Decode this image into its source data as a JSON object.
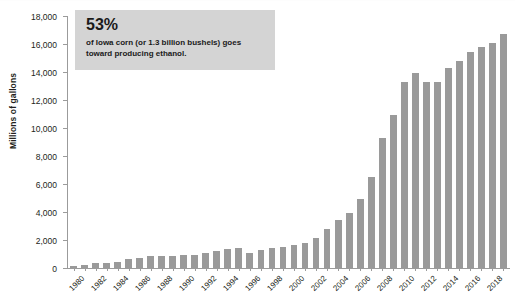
{
  "chart_data": {
    "type": "bar",
    "title": "",
    "subtitle": "",
    "xlabel": "",
    "ylabel": "Millions of gallons",
    "ylim": [
      0,
      18000
    ],
    "ytick_values": [
      0,
      2000,
      4000,
      6000,
      8000,
      10000,
      12000,
      14000,
      16000,
      18000
    ],
    "ytick_labels": [
      "0",
      "2,000",
      "4,000",
      "6,000",
      "8,000",
      "10,000",
      "12,000",
      "14,000",
      "16,000",
      "18,000"
    ],
    "grid": false,
    "legend": "none",
    "bar_color": "#9a9a9a",
    "categories": [
      "1980",
      "1981",
      "1982",
      "1983",
      "1984",
      "1985",
      "1986",
      "1987",
      "1988",
      "1989",
      "1990",
      "1991",
      "1992",
      "1993",
      "1994",
      "1995",
      "1996",
      "1997",
      "1998",
      "1999",
      "2000",
      "2001",
      "2002",
      "2003",
      "2004",
      "2005",
      "2006",
      "2007",
      "2008",
      "2009",
      "2010",
      "2011",
      "2012",
      "2013",
      "2014",
      "2015",
      "2016",
      "2017",
      "2018",
      "2019"
    ],
    "xtick_labels": [
      "1980",
      "1982",
      "1984",
      "1986",
      "1988",
      "1990",
      "1992",
      "1994",
      "1996",
      "1998",
      "2000",
      "2002",
      "2004",
      "2006",
      "2008",
      "2010",
      "2012",
      "2014",
      "2016",
      "2018"
    ],
    "values": [
      175,
      215,
      350,
      375,
      430,
      610,
      710,
      830,
      845,
      870,
      900,
      950,
      1100,
      1200,
      1350,
      1400,
      1100,
      1300,
      1400,
      1470,
      1630,
      1770,
      2130,
      2800,
      3400,
      3900,
      4900,
      6500,
      9300,
      10900,
      13300,
      13900,
      13300,
      13300,
      14300,
      14800,
      15400,
      15800,
      16100,
      16750
    ]
  },
  "annotation": {
    "stat": "53%",
    "line1": "of Iowa corn (or 1.3 billion bushels) goes",
    "line2": "toward producing ethanol.",
    "background_color": "#d4d4d4"
  }
}
